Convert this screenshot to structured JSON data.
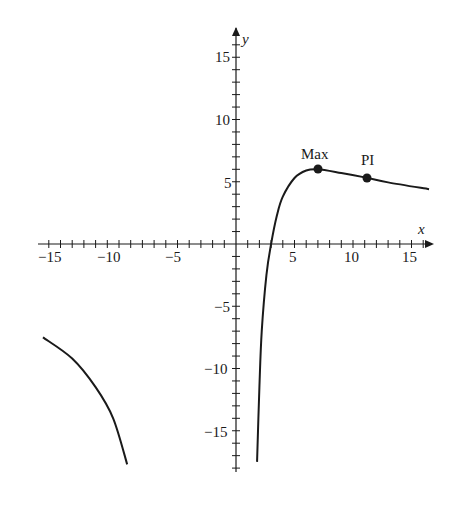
{
  "chart_data": {
    "type": "line",
    "title": "",
    "xlabel": "x",
    "ylabel": "y",
    "xlim": [
      -16.5,
      16.5
    ],
    "ylim": [
      -18,
      17
    ],
    "grid": false,
    "x_ticks": [
      "-15",
      "-10",
      "-5",
      "5",
      "10",
      "15"
    ],
    "y_ticks": [
      "15",
      "10",
      "5",
      "-5",
      "-10",
      "-15"
    ],
    "series": [
      {
        "name": "right-branch",
        "points": [
          [
            1.8,
            -17.5
          ],
          [
            2.0,
            -11.5
          ],
          [
            2.2,
            -7
          ],
          [
            2.6,
            -2.5
          ],
          [
            3,
            0
          ],
          [
            3.5,
            2.3
          ],
          [
            4,
            3.8
          ],
          [
            5,
            5.3
          ],
          [
            6,
            5.9
          ],
          [
            7,
            6.0
          ],
          [
            9,
            5.7
          ],
          [
            11,
            5.35
          ],
          [
            13,
            4.95
          ],
          [
            16.5,
            4.4
          ]
        ]
      },
      {
        "name": "left-branch",
        "points": [
          [
            -16.5,
            -7.5
          ],
          [
            -14,
            -9.2
          ],
          [
            -12,
            -11.5
          ],
          [
            -10.5,
            -14
          ],
          [
            -9.3,
            -17.7
          ]
        ]
      }
    ],
    "annotations": [
      {
        "label": "Max",
        "x": 7,
        "y": 6.0
      },
      {
        "label": "PI",
        "x": 11.2,
        "y": 5.3
      }
    ]
  },
  "labels": {
    "x_axis": "x",
    "y_axis": "y",
    "max": "Max",
    "pi": "PI",
    "xt": {
      "m15": "−15",
      "m10": "−10",
      "m5": "−5",
      "p5": "5",
      "p10": "10",
      "p15": "15"
    },
    "yt": {
      "p15": "15",
      "p10": "10",
      "p5": "5",
      "m5": "−5",
      "m10": "−10",
      "m15": "−15"
    }
  },
  "colors": {
    "ink": "#1a1a1a",
    "background": "#ffffff"
  }
}
